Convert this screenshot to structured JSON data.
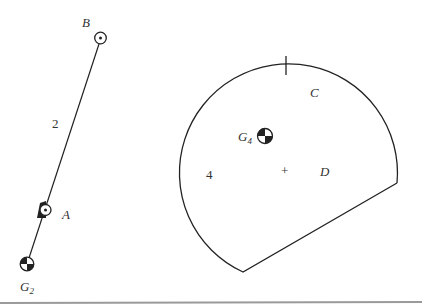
{
  "diagram": {
    "type": "mechanism-link-diagram",
    "colors": {
      "stroke": "#222222",
      "label": "#333333",
      "baseline": "#9a9a9a",
      "background": "#ffffff"
    },
    "link2": {
      "number_label": "2",
      "pin_B_label": "B",
      "pin_A_label": "A",
      "cg_label": "G",
      "cg_subscript": "2"
    },
    "link4": {
      "number_label": "4",
      "point_C_label": "C",
      "point_D_label": "D",
      "cg_label": "G",
      "cg_subscript": "4",
      "center_mark": "+"
    }
  }
}
